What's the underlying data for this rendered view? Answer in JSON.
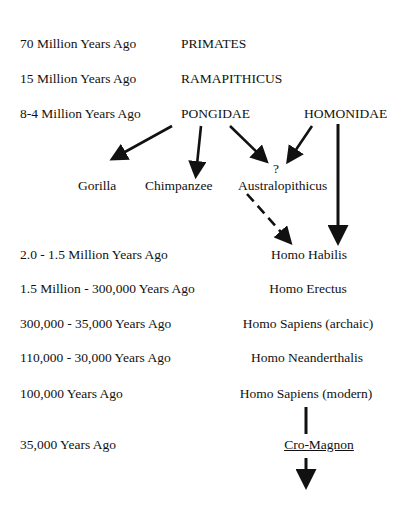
{
  "timeline": [
    {
      "period": "70 Million Years Ago",
      "taxon": "PRIMATES"
    },
    {
      "period": "15 Million Years Ago",
      "taxon": "RAMAPITHICUS"
    },
    {
      "period": "8-4 Million Years Ago",
      "taxon": "PONGIDAE",
      "taxon2": "HOMONIDAE"
    },
    {
      "period": "2.0 - 1.5 Million Years Ago",
      "taxon": "Homo Habilis"
    },
    {
      "period": "1.5 Million - 300,000 Years Ago",
      "taxon": "Homo Erectus"
    },
    {
      "period": "300,000 - 35,000 Years Ago",
      "taxon": "Homo Sapiens (archaic)"
    },
    {
      "period": "110,000 - 30,000 Years Ago",
      "taxon": "Homo Neanderthalis"
    },
    {
      "period": "100,000 Years Ago",
      "taxon": "Homo Sapiens (modern)"
    },
    {
      "period": "35,000 Years Ago",
      "taxon": "Cro-Magnon"
    }
  ],
  "branches": {
    "gorilla": "Gorilla",
    "chimpanzee": "Chimpanzee",
    "australopithicus": "Australopithicus",
    "uncertain": "?"
  }
}
